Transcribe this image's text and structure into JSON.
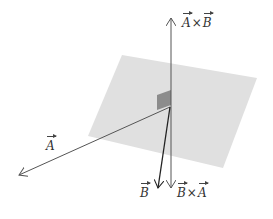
{
  "diagram": {
    "colors": {
      "plane": "#e0e0e0",
      "square": "#8c8c8c",
      "vector_A": "#555555",
      "vector_B": "#222222",
      "axis": "#555555"
    },
    "labels": {
      "A": "A",
      "B": "B",
      "AxB_left": "A",
      "AxB_op": "×",
      "AxB_right": "B",
      "BxA_left": "B",
      "BxA_op": "×",
      "BxA_right": "A"
    },
    "geometry": {
      "origin": [
        170,
        107
      ],
      "plane_corners": [
        [
          122,
          55
        ],
        [
          257,
          78
        ],
        [
          223,
          168
        ],
        [
          88,
          136
        ]
      ],
      "vector_A_tip": [
        18,
        175
      ],
      "vector_B_tip": [
        158,
        188
      ],
      "AxB_tip": [
        171,
        17
      ],
      "BxA_tip": [
        171,
        188
      ]
    }
  }
}
